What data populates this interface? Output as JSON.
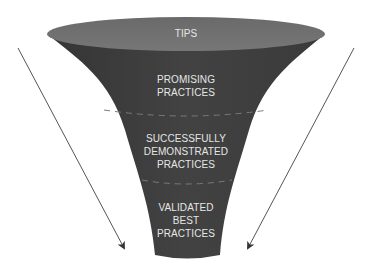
{
  "diagram": {
    "type": "funnel",
    "colors": {
      "funnel_body": "#3d3d3d",
      "funnel_top": "#6e6e6e",
      "label_text": "#e6e6e6",
      "divider": "#7a7a7a",
      "arrow": "#555555",
      "background": "#ffffff"
    },
    "stages": [
      {
        "id": "tips",
        "lines": [
          "TIPS"
        ]
      },
      {
        "id": "promising",
        "lines": [
          "PROMISING",
          "PRACTICES"
        ]
      },
      {
        "id": "successfully-demonstrated",
        "lines": [
          "SUCCESSFULLY",
          "DEMONSTRATED",
          "PRACTICES"
        ]
      },
      {
        "id": "validated-best",
        "lines": [
          "VALIDATED",
          "BEST",
          "PRACTICES"
        ]
      }
    ],
    "arrows": [
      {
        "id": "left",
        "direction": "down-right"
      },
      {
        "id": "right",
        "direction": "down-left"
      }
    ]
  }
}
